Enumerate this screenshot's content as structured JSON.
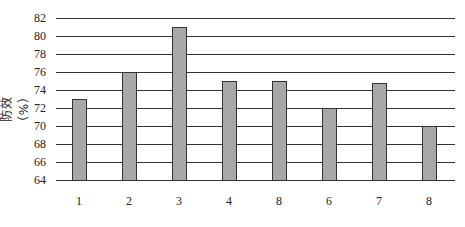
{
  "chart_data": {
    "type": "bar",
    "title": "",
    "xlabel": "",
    "ylabel": "防效（%）",
    "categories": [
      "1",
      "2",
      "3",
      "4",
      "8",
      "6",
      "7",
      "8"
    ],
    "values": [
      73,
      76,
      81,
      75,
      75,
      72,
      74.8,
      70
    ],
    "ylim": [
      64,
      82
    ],
    "yticks": [
      64,
      66,
      68,
      70,
      72,
      74,
      76,
      78,
      80,
      82
    ],
    "grid": true,
    "legend": null,
    "colors": {
      "bar_fill": "#a8a8a8",
      "bar_stroke": "#333333",
      "grid": "#333333"
    }
  }
}
